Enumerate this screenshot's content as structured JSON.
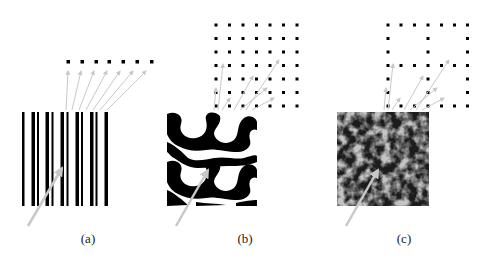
{
  "figure": {
    "panels": [
      {
        "id": "a",
        "label": "(a)",
        "label_x": 88,
        "description": "vertical bar (stripe) texture mapped to a 1D row of 7 dots"
      },
      {
        "id": "b",
        "label": "(b)",
        "label_x": 245,
        "description": "black-white blob texture mapped to a 7x7 full dot lattice"
      },
      {
        "id": "c",
        "label": "(c)",
        "label_x": 404,
        "description": "grayscale noisy texture mapped to a 7x7 lattice with two hollow squares pattern"
      }
    ],
    "colors": {
      "ink": "#000000",
      "arrow": "#c8c8c8",
      "background": "#ffffff"
    }
  }
}
